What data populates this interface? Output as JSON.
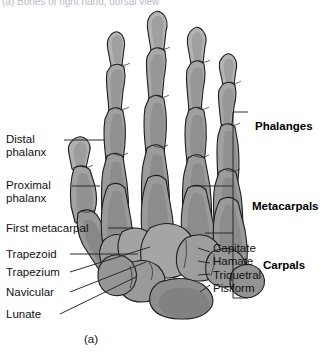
{
  "figure": {
    "title_cropped": "(a) Bones of right hand, dorsal view",
    "caption": "(a)",
    "type": "anatomical-illustration",
    "bone_fill": "#9b9b9b",
    "bone_fill_light": "#c6c6c6",
    "bone_fill_shadow": "#6e6e6e",
    "outline_color": "#1c1c1c",
    "leader_color": "#2b2b2b",
    "background": "#ffffff"
  },
  "left_labels": [
    {
      "text": "Distal\nphalanx",
      "id": "distal-phalanx"
    },
    {
      "text": "Proximal\nphalanx",
      "id": "proximal-phalanx"
    },
    {
      "text": "First metacarpal",
      "id": "first-metacarpal"
    },
    {
      "text": "Trapezoid",
      "id": "trapezoid"
    },
    {
      "text": "Trapezium",
      "id": "trapezium"
    },
    {
      "text": "Navicular",
      "id": "navicular"
    },
    {
      "text": "Lunate",
      "id": "lunate"
    }
  ],
  "right_labels": [
    {
      "text": "Capitate",
      "id": "capitate"
    },
    {
      "text": "Hamate",
      "id": "hamate"
    },
    {
      "text": "Triquetral",
      "id": "triquetral"
    },
    {
      "text": "Pisiform",
      "id": "pisiform"
    }
  ],
  "bracket_labels": [
    {
      "text": "Phalanges",
      "id": "phalanges"
    },
    {
      "text": "Metacarpals",
      "id": "metacarpals"
    },
    {
      "text": "Carpals",
      "id": "carpals"
    }
  ]
}
